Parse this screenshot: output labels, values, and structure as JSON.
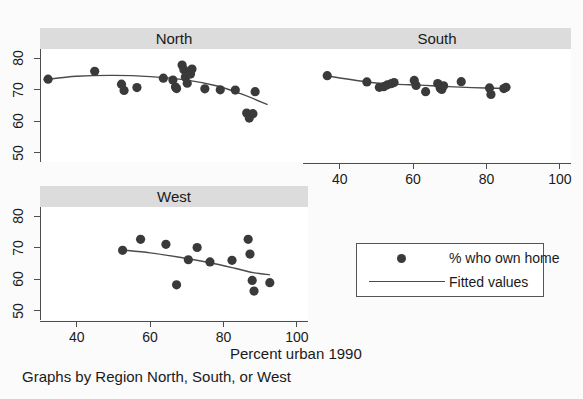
{
  "chart_data": {
    "type": "scatter",
    "title": "",
    "xlabel": "Percent urban 1990",
    "ylabel": "",
    "caption": "Graphs by Region North, South, or West",
    "grid": false,
    "xlim": [
      30,
      103
    ],
    "ylim": [
      47,
      83
    ],
    "xticks": [
      40,
      60,
      80,
      100
    ],
    "yticks": [
      50,
      60,
      70,
      80
    ],
    "legend": {
      "position": "bottom-right",
      "entries": [
        {
          "key": "marker",
          "label": "% who own home"
        },
        {
          "key": "line",
          "label": "Fitted values"
        }
      ]
    },
    "panels": [
      {
        "name": "north",
        "title": "North",
        "show_xticks": false,
        "show_yticks": true,
        "points": [
          {
            "x": 32.2,
            "y": 73.4
          },
          {
            "x": 44.9,
            "y": 75.9
          },
          {
            "x": 52.2,
            "y": 71.8
          },
          {
            "x": 52.9,
            "y": 69.8
          },
          {
            "x": 56.4,
            "y": 70.7
          },
          {
            "x": 63.6,
            "y": 73.7
          },
          {
            "x": 66.2,
            "y": 73.1
          },
          {
            "x": 66.9,
            "y": 70.9
          },
          {
            "x": 67.2,
            "y": 70.4
          },
          {
            "x": 68.7,
            "y": 77.9
          },
          {
            "x": 69.2,
            "y": 76.4
          },
          {
            "x": 69.6,
            "y": 74.1
          },
          {
            "x": 70.1,
            "y": 72.1
          },
          {
            "x": 71.0,
            "y": 75.0
          },
          {
            "x": 71.4,
            "y": 76.6
          },
          {
            "x": 74.9,
            "y": 70.3
          },
          {
            "x": 79.1,
            "y": 70.0
          },
          {
            "x": 83.2,
            "y": 69.9
          },
          {
            "x": 86.3,
            "y": 62.6
          },
          {
            "x": 87.0,
            "y": 61.0
          },
          {
            "x": 88.0,
            "y": 62.4
          },
          {
            "x": 88.6,
            "y": 69.4
          }
        ],
        "fit": [
          {
            "x": 31.0,
            "y": 73.2
          },
          {
            "x": 40.0,
            "y": 74.3
          },
          {
            "x": 50.0,
            "y": 74.6
          },
          {
            "x": 60.0,
            "y": 74.2
          },
          {
            "x": 70.0,
            "y": 73.1
          },
          {
            "x": 78.0,
            "y": 71.3
          },
          {
            "x": 85.0,
            "y": 68.6
          },
          {
            "x": 92.0,
            "y": 65.3
          }
        ]
      },
      {
        "name": "south",
        "title": "South",
        "show_xticks": true,
        "show_yticks": false,
        "points": [
          {
            "x": 36.6,
            "y": 74.5
          },
          {
            "x": 47.4,
            "y": 72.5
          },
          {
            "x": 50.8,
            "y": 70.8
          },
          {
            "x": 52.0,
            "y": 71.0
          },
          {
            "x": 53.0,
            "y": 71.6
          },
          {
            "x": 54.1,
            "y": 72.0
          },
          {
            "x": 54.8,
            "y": 72.3
          },
          {
            "x": 60.3,
            "y": 73.0
          },
          {
            "x": 60.8,
            "y": 71.4
          },
          {
            "x": 63.4,
            "y": 69.4
          },
          {
            "x": 66.7,
            "y": 72.0
          },
          {
            "x": 67.4,
            "y": 70.5
          },
          {
            "x": 67.8,
            "y": 70.1
          },
          {
            "x": 68.3,
            "y": 71.3
          },
          {
            "x": 73.1,
            "y": 72.6
          },
          {
            "x": 80.8,
            "y": 70.6
          },
          {
            "x": 81.2,
            "y": 68.5
          },
          {
            "x": 84.7,
            "y": 70.4
          },
          {
            "x": 85.3,
            "y": 70.8
          }
        ],
        "fit": [
          {
            "x": 36.6,
            "y": 74.4
          },
          {
            "x": 48.0,
            "y": 72.4
          },
          {
            "x": 55.0,
            "y": 71.8
          },
          {
            "x": 62.0,
            "y": 71.5
          },
          {
            "x": 68.0,
            "y": 71.1
          },
          {
            "x": 76.0,
            "y": 70.7
          },
          {
            "x": 85.3,
            "y": 70.4
          }
        ]
      },
      {
        "name": "west",
        "title": "West",
        "show_xticks": true,
        "show_yticks": true,
        "points": [
          {
            "x": 52.5,
            "y": 69.2
          },
          {
            "x": 57.4,
            "y": 72.7
          },
          {
            "x": 64.3,
            "y": 71.1
          },
          {
            "x": 67.2,
            "y": 58.2
          },
          {
            "x": 70.4,
            "y": 66.2
          },
          {
            "x": 72.8,
            "y": 70.1
          },
          {
            "x": 76.3,
            "y": 65.5
          },
          {
            "x": 82.3,
            "y": 66.0
          },
          {
            "x": 86.7,
            "y": 72.7
          },
          {
            "x": 87.2,
            "y": 68.0
          },
          {
            "x": 87.8,
            "y": 59.6
          },
          {
            "x": 88.3,
            "y": 56.2
          },
          {
            "x": 92.6,
            "y": 58.9
          }
        ],
        "fit": [
          {
            "x": 52.5,
            "y": 69.3
          },
          {
            "x": 60.0,
            "y": 68.4
          },
          {
            "x": 68.0,
            "y": 67.0
          },
          {
            "x": 76.0,
            "y": 65.3
          },
          {
            "x": 83.0,
            "y": 63.5
          },
          {
            "x": 88.0,
            "y": 62.1
          },
          {
            "x": 92.6,
            "y": 61.4
          }
        ]
      }
    ]
  },
  "labels": {
    "north_title": "North",
    "south_title": "South",
    "west_title": "West",
    "xaxis_title": "Percent urban 1990",
    "caption": "Graphs by Region North, South, or West",
    "legend_marker_label": "% who own home",
    "legend_line_label": "Fitted values",
    "xtick_40": "40",
    "xtick_60": "60",
    "xtick_80": "80",
    "xtick_100": "100",
    "ytick_50": "50",
    "ytick_60": "60",
    "ytick_70": "70",
    "ytick_80": "80"
  },
  "colors": {
    "marker": "#3a3a3a",
    "line": "#4a4a4a",
    "title_bar": "#dcdcdc",
    "axis": "#4d4d4d",
    "panel_bg": "#ffffff",
    "figure_bg": "#fbfbfb"
  }
}
